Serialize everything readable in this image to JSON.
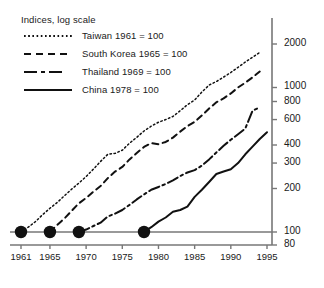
{
  "chart_data": {
    "type": "line",
    "title": "Indices, log scale",
    "xlabel": "",
    "ylabel": "",
    "yscale": "log",
    "ylim": [
      80,
      2400
    ],
    "xlim": [
      1960,
      1996
    ],
    "grid": false,
    "legend_position": "top-left",
    "yticks": [
      80,
      100,
      200,
      300,
      400,
      600,
      800,
      1000,
      2000
    ],
    "ytick_labels": [
      "80",
      "100",
      "200",
      "300",
      "400",
      "600",
      "800",
      "1000",
      "2000"
    ],
    "xticks": [
      1961,
      1965,
      1970,
      1975,
      1980,
      1985,
      1990,
      1995
    ],
    "xtick_labels": [
      "1961",
      "1965",
      "1970",
      "1975",
      "1980",
      "1985",
      "1990",
      "1995"
    ],
    "baseline_value": 100,
    "start_markers": [
      {
        "series": "Taiwan",
        "x": 1961,
        "y": 100
      },
      {
        "series": "South Korea",
        "x": 1965,
        "y": 100
      },
      {
        "series": "Thailand",
        "x": 1969,
        "y": 100
      },
      {
        "series": "China",
        "x": 1978,
        "y": 100
      }
    ],
    "series": [
      {
        "name": "Taiwan 1961 = 100",
        "label": "Taiwan",
        "base_year": 1961,
        "style": "dotted",
        "color": "#111111",
        "x": [
          1961,
          1962,
          1963,
          1964,
          1965,
          1966,
          1967,
          1968,
          1969,
          1970,
          1971,
          1972,
          1973,
          1974,
          1975,
          1976,
          1977,
          1978,
          1979,
          1980,
          1981,
          1982,
          1983,
          1984,
          1985,
          1986,
          1987,
          1988,
          1989,
          1990,
          1991,
          1992,
          1993,
          1994
        ],
        "y": [
          100,
          108,
          118,
          132,
          146,
          160,
          178,
          198,
          218,
          242,
          272,
          308,
          345,
          350,
          368,
          412,
          452,
          500,
          540,
          575,
          600,
          630,
          690,
          760,
          820,
          930,
          1040,
          1100,
          1180,
          1270,
          1380,
          1500,
          1620,
          1750
        ]
      },
      {
        "name": "South Korea 1965 = 100",
        "label": "South Korea",
        "base_year": 1965,
        "style": "dashed",
        "color": "#111111",
        "x": [
          1965,
          1966,
          1967,
          1968,
          1969,
          1970,
          1971,
          1972,
          1973,
          1974,
          1975,
          1976,
          1977,
          1978,
          1979,
          1980,
          1981,
          1982,
          1983,
          1984,
          1985,
          1986,
          1987,
          1988,
          1989,
          1990,
          1991,
          1992,
          1993,
          1994
        ],
        "y": [
          100,
          112,
          124,
          140,
          158,
          172,
          190,
          208,
          236,
          262,
          282,
          318,
          352,
          388,
          412,
          405,
          420,
          450,
          495,
          540,
          578,
          640,
          715,
          790,
          840,
          910,
          1000,
          1080,
          1175,
          1290
        ]
      },
      {
        "name": "Thailand 1969 = 100",
        "label": "Thailand",
        "base_year": 1969,
        "style": "dashdot",
        "color": "#111111",
        "x": [
          1969,
          1970,
          1971,
          1972,
          1973,
          1974,
          1975,
          1976,
          1977,
          1978,
          1979,
          1980,
          1981,
          1982,
          1983,
          1984,
          1985,
          1986,
          1987,
          1988,
          1989,
          1990,
          1991,
          1992,
          1993,
          1994
        ],
        "y": [
          100,
          104,
          110,
          116,
          128,
          134,
          142,
          154,
          168,
          182,
          196,
          205,
          215,
          228,
          244,
          258,
          268,
          288,
          318,
          355,
          395,
          435,
          475,
          520,
          690,
          730
        ]
      },
      {
        "name": "China 1978 = 100",
        "label": "China",
        "base_year": 1978,
        "style": "solid",
        "color": "#111111",
        "x": [
          1978,
          1979,
          1980,
          1981,
          1982,
          1983,
          1984,
          1985,
          1986,
          1987,
          1988,
          1989,
          1990,
          1991,
          1992,
          1993,
          1994,
          1995
        ],
        "y": [
          100,
          108,
          118,
          126,
          138,
          142,
          150,
          175,
          196,
          222,
          252,
          262,
          272,
          300,
          345,
          390,
          440,
          490
        ]
      }
    ]
  },
  "legend": {
    "title": "Indices, log scale",
    "items": [
      {
        "label": "Taiwan 1961 = 100",
        "style": "dotted"
      },
      {
        "label": "South Korea 1965 = 100",
        "style": "dashed"
      },
      {
        "label": "Thailand 1969 = 100",
        "style": "dashdot"
      },
      {
        "label": "China 1978 = 100",
        "style": "solid"
      }
    ]
  }
}
